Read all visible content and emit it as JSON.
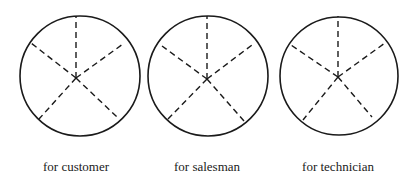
{
  "figure": {
    "stroke_color": "#1a1a1a",
    "background": "#ffffff",
    "pies": [
      {
        "label": "for customer",
        "circle": {
          "cx": 80,
          "cy": 76,
          "r": 60
        },
        "center": {
          "x": 76,
          "y": 78
        },
        "spokes": [
          {
            "x": 76,
            "y": 16
          },
          {
            "x": 123,
            "y": 44
          },
          {
            "x": 117,
            "y": 117
          },
          {
            "x": 39,
            "y": 119
          },
          {
            "x": 31,
            "y": 43
          }
        ],
        "label_pos": {
          "x": 76,
          "y": 171
        }
      },
      {
        "label": "for salesman",
        "circle": {
          "cx": 208,
          "cy": 76,
          "r": 60
        },
        "center": {
          "x": 207,
          "y": 79
        },
        "spokes": [
          {
            "x": 207,
            "y": 16
          },
          {
            "x": 252,
            "y": 45
          },
          {
            "x": 244,
            "y": 121
          },
          {
            "x": 168,
            "y": 119
          },
          {
            "x": 162,
            "y": 46
          }
        ],
        "label_pos": {
          "x": 207,
          "y": 171
        }
      },
      {
        "label": "for technician",
        "circle": {
          "cx": 339,
          "cy": 76,
          "r": 59
        },
        "center": {
          "x": 338,
          "y": 77
        },
        "spokes": [
          {
            "x": 338,
            "y": 16
          },
          {
            "x": 385,
            "y": 43
          },
          {
            "x": 372,
            "y": 117
          },
          {
            "x": 303,
            "y": 120
          },
          {
            "x": 291,
            "y": 45
          }
        ],
        "label_pos": {
          "x": 338,
          "y": 171
        }
      }
    ]
  }
}
